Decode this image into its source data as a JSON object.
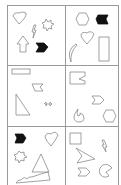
{
  "title": "",
  "panels": [
    {
      "id": "panel-1",
      "shapes": [
        "heart",
        "lightning-bolt",
        "starburst",
        "arrow-up",
        "chevron-filled"
      ]
    },
    {
      "id": "panel-2",
      "shapes": [
        "hexagon",
        "chevron-filled",
        "heart",
        "crescent",
        "rectangle"
      ]
    },
    {
      "id": "panel-3",
      "shapes": [
        "rectangle",
        "notched-pentagon",
        "right-triangle",
        "double-arrow"
      ]
    },
    {
      "id": "panel-4",
      "shapes": [
        "notched-square",
        "chevron",
        "pacman-flame",
        "hexagon"
      ]
    },
    {
      "id": "panel-5",
      "shapes": [
        "chevron-filled",
        "heart",
        "starburst",
        "triangle",
        "zigzag-wave"
      ]
    },
    {
      "id": "panel-6",
      "shapes": [
        "square",
        "lightning-bolt",
        "arrowhead",
        "chevron",
        "pacman"
      ]
    }
  ],
  "colors": {
    "stroke": "#8a8a8a",
    "fill": "#111111",
    "border": "#9a9a9a"
  }
}
